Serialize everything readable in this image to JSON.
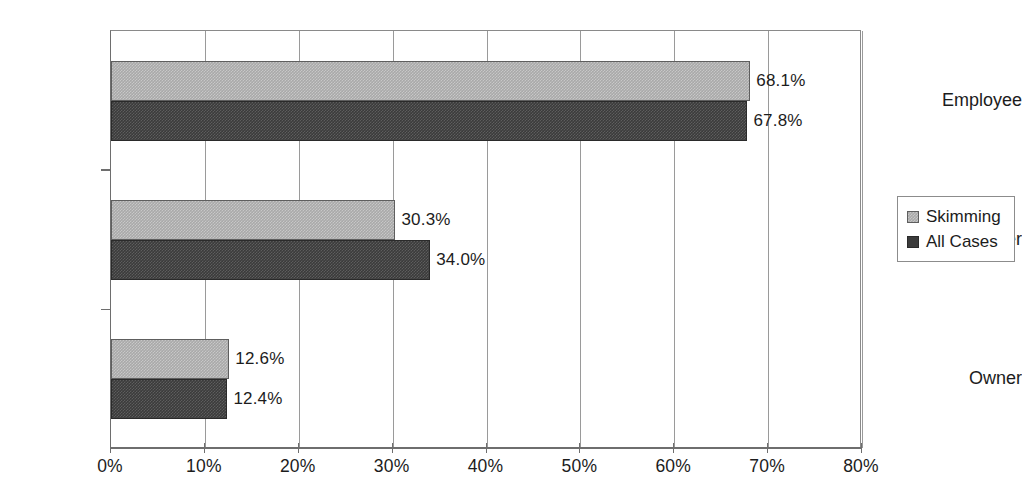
{
  "chart_data": {
    "type": "bar",
    "orientation": "horizontal",
    "title": "",
    "subtitle": "",
    "xlabel": "",
    "ylabel": "",
    "categories": [
      "Employee",
      "Manager",
      "Owner"
    ],
    "series": [
      {
        "name": "Skimming",
        "color": "#a9a9a9",
        "values": [
          68.1,
          30.3,
          12.6
        ],
        "value_labels": [
          "68.1%",
          "30.3%",
          "12.6%"
        ]
      },
      {
        "name": "All Cases",
        "color": "#3b3b3b",
        "values": [
          67.8,
          34.0,
          12.4
        ],
        "value_labels": [
          "67.8%",
          "34.0%",
          "12.4%"
        ]
      }
    ],
    "xlim": [
      0,
      80
    ],
    "xticks": [
      0,
      10,
      20,
      30,
      40,
      50,
      60,
      70,
      80
    ],
    "xtick_labels": [
      "0%",
      "10%",
      "20%",
      "30%",
      "40%",
      "50%",
      "60%",
      "70%",
      "80%"
    ],
    "grid": "vertical",
    "legend_position": "right",
    "legend_entries": [
      "Skimming",
      "All Cases"
    ]
  },
  "legend": {
    "items": [
      {
        "label": "Skimming",
        "swatch_class": "series-skimming"
      },
      {
        "label": "All Cases",
        "swatch_class": "series-all-cases"
      }
    ]
  }
}
